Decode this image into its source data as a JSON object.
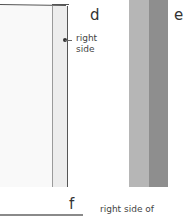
{
  "figure": {
    "panels": [
      {
        "id": "d",
        "letter": "d",
        "label_line1": "right",
        "label_line2": "side"
      },
      {
        "id": "e",
        "letter": "e"
      },
      {
        "id": "f",
        "letter": "f",
        "label": "right side of"
      }
    ],
    "colors": {
      "fabric_panel": "#f9f9f9",
      "folded_strip": "#ededed",
      "outline": "#555555",
      "tape_light": "#b6b6b6",
      "tape_dark": "#8e8e8e",
      "bottom_bar": "#8a8a8a"
    }
  }
}
